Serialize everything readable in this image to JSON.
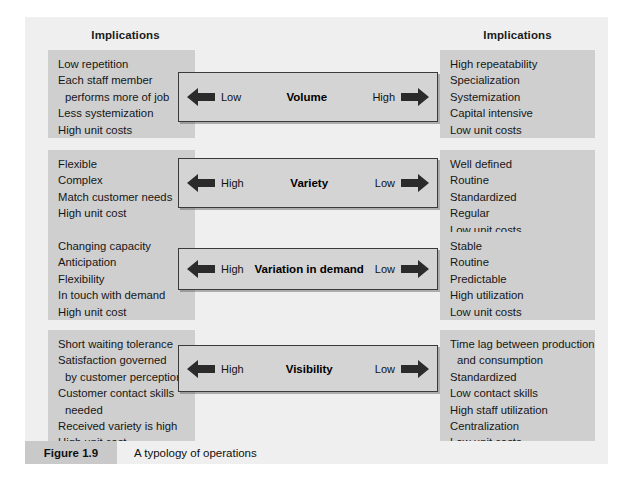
{
  "figure": {
    "caption_tag": "Figure 1.9",
    "caption_text": "A typology of operations",
    "background": "#efefef",
    "box_color": "#cfcfcf",
    "bar_fill": "#d4d4d4",
    "bar_border": "#3a3a3a"
  },
  "headers": {
    "left": "Implications",
    "right": "Implications"
  },
  "dimensions": [
    {
      "title": "Volume",
      "left_label": "Low",
      "right_label": "High",
      "left_arrow_icon": "arrow-left-icon",
      "right_arrow_icon": "arrow-right-icon",
      "left_implications": [
        {
          "text": "Low repetition",
          "indent": false
        },
        {
          "text": "Each staff member",
          "indent": false
        },
        {
          "text": "performs more of job",
          "indent": true
        },
        {
          "text": "Less systemization",
          "indent": false
        },
        {
          "text": "High unit costs",
          "indent": false
        }
      ],
      "right_implications": [
        {
          "text": "High repeatability",
          "indent": false
        },
        {
          "text": "Specialization",
          "indent": false
        },
        {
          "text": "Systemization",
          "indent": false
        },
        {
          "text": "Capital intensive",
          "indent": false
        },
        {
          "text": "Low unit costs",
          "indent": false
        }
      ]
    },
    {
      "title": "Variety",
      "left_label": "High",
      "right_label": "Low",
      "left_arrow_icon": "arrow-left-icon",
      "right_arrow_icon": "arrow-right-icon",
      "left_implications": [
        {
          "text": "Flexible",
          "indent": false
        },
        {
          "text": "Complex",
          "indent": false
        },
        {
          "text": "Match customer needs",
          "indent": false
        },
        {
          "text": "High unit cost",
          "indent": false
        }
      ],
      "right_implications": [
        {
          "text": "Well defined",
          "indent": false
        },
        {
          "text": "Routine",
          "indent": false
        },
        {
          "text": "Standardized",
          "indent": false
        },
        {
          "text": "Regular",
          "indent": false
        },
        {
          "text": "Low unit costs",
          "indent": false
        }
      ]
    },
    {
      "title": "Variation in demand",
      "left_label": "High",
      "right_label": "Low",
      "left_arrow_icon": "arrow-left-icon",
      "right_arrow_icon": "arrow-right-icon",
      "left_implications": [
        {
          "text": "Changing capacity",
          "indent": false
        },
        {
          "text": "Anticipation",
          "indent": false
        },
        {
          "text": "Flexibility",
          "indent": false
        },
        {
          "text": "In touch with demand",
          "indent": false
        },
        {
          "text": "High unit cost",
          "indent": false
        }
      ],
      "right_implications": [
        {
          "text": "Stable",
          "indent": false
        },
        {
          "text": "Routine",
          "indent": false
        },
        {
          "text": "Predictable",
          "indent": false
        },
        {
          "text": "High utilization",
          "indent": false
        },
        {
          "text": "Low unit costs",
          "indent": false
        }
      ]
    },
    {
      "title": "Visibility",
      "left_label": "High",
      "right_label": "Low",
      "left_arrow_icon": "arrow-left-icon",
      "right_arrow_icon": "arrow-right-icon",
      "left_implications": [
        {
          "text": "Short waiting tolerance",
          "indent": false
        },
        {
          "text": "Satisfaction governed",
          "indent": false
        },
        {
          "text": "by customer perception",
          "indent": true
        },
        {
          "text": "Customer contact skills",
          "indent": false
        },
        {
          "text": "needed",
          "indent": true
        },
        {
          "text": "Received variety is high",
          "indent": false
        },
        {
          "text": "High unit cost",
          "indent": false
        }
      ],
      "right_implications": [
        {
          "text": "Time lag between production",
          "indent": false
        },
        {
          "text": "and consumption",
          "indent": true
        },
        {
          "text": "Standardized",
          "indent": false
        },
        {
          "text": "Low contact skills",
          "indent": false
        },
        {
          "text": "High staff utilization",
          "indent": false
        },
        {
          "text": "Centralization",
          "indent": false
        },
        {
          "text": "Low unit costs",
          "indent": false
        }
      ]
    }
  ]
}
